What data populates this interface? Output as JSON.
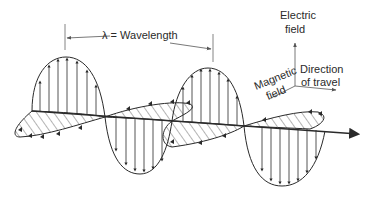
{
  "diagram": {
    "wavelength_label": "λ = Wavelength",
    "axes_legend": {
      "electric": [
        "Electric",
        "field"
      ],
      "magnetic": [
        "Magnetic",
        "field"
      ],
      "direction": [
        "Direction",
        "of travel"
      ]
    },
    "colors": {
      "stroke": "#2a2a2a",
      "background": "#ffffff"
    }
  }
}
